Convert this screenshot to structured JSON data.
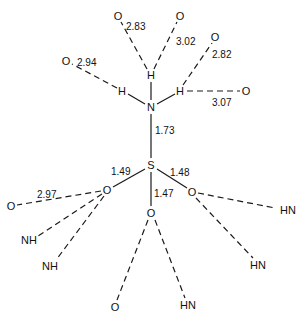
{
  "diagram": {
    "type": "molecular-structure",
    "atoms": {
      "N": "N",
      "S": "S",
      "H_top": "H",
      "H_left": "H",
      "H_right": "H",
      "O_s1": "O",
      "O_s2": "O",
      "O_s3": "O",
      "O_hb_283": "O",
      "O_hb_302": "O",
      "O_hb_282": "O",
      "O_hb_294": "O",
      "O_hb_307": "O",
      "O_hb_297": "O",
      "O_hb_bottom": "O",
      "NH_1": "NH",
      "NH_2": "NH",
      "HN_1": "HN",
      "HN_2": "HN",
      "HN_3": "HN",
      "HN_4": "HN"
    },
    "bond_lengths": {
      "N_S": "1.73",
      "S_O_left": "1.49",
      "S_O_right": "1.48",
      "S_O_middle": "1.47"
    },
    "hbond_distances": {
      "H_top_O_left": "2.83",
      "H_top_O_right": "3.02",
      "H_right_O_upper": "2.82",
      "H_left_O": "2.94",
      "H_right_O": "3.07",
      "O_left_O": "2.97"
    }
  },
  "caption": {
    "text": ""
  }
}
